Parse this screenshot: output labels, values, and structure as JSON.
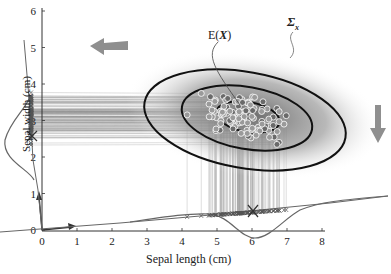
{
  "chart_data": {
    "type": "scatter",
    "title": "",
    "xlabel": "Sepal length (cm)",
    "ylabel": "Sepal width (cm)",
    "x_ticks": [
      "0",
      "1",
      "2",
      "3",
      "4",
      "5",
      "6",
      "7",
      "8"
    ],
    "y_ticks": [
      "0",
      "1",
      "2",
      "3",
      "4",
      "5",
      "6"
    ],
    "xlim": [
      0,
      8
    ],
    "ylim": [
      0,
      6
    ],
    "annotations": {
      "mean": "E(X)",
      "covariance": "Σx"
    },
    "mean_point": {
      "x": 5.84,
      "y": 3.06
    },
    "ellipses": 3,
    "marginal_x_density_peak": 6,
    "marginal_y_density_peak": 3,
    "arrows": [
      "left (project onto sepal width axis)",
      "down (project onto sepal length axis)"
    ],
    "grid": false,
    "legend": "none"
  },
  "labels": {
    "xlabel": "Sepal length (cm)",
    "ylabel": "Sepal width (cm)",
    "mean": "E(",
    "mean_var": "X",
    "mean_close": ")",
    "sigma": "Σ",
    "sigma_sub": "x"
  },
  "colors": {
    "axis": "#333333",
    "ellipse": "#111111",
    "arrow": "#8f8f8f",
    "point_fill": "#9a9a9a",
    "point_stroke": "#ffffff",
    "projection_line": "#8a8a8a"
  }
}
